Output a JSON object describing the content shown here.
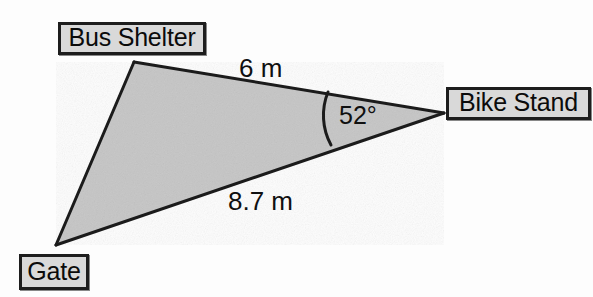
{
  "figure": {
    "kind": "triangle-survey-diagram",
    "background_color": "#fdfdfd",
    "triangle": {
      "fill_color": "#c5c5c5",
      "stroke_color": "#1b1b1b",
      "vertices": [
        {
          "name": "bus-shelter",
          "label": "Bus Shelter",
          "x": 134,
          "y": 62
        },
        {
          "name": "bike-stand",
          "label": "Bike Stand",
          "x": 444,
          "y": 113
        },
        {
          "name": "gate",
          "label": "Gate",
          "x": 56,
          "y": 245
        }
      ]
    },
    "labels": {
      "bus_shelter": "Bus Shelter",
      "bike_stand": "Bike Stand",
      "gate": "Gate",
      "box_fill_color": "#d9d9d9",
      "box_border_color": "#1d1d1d",
      "text_color": "#0b0b0b"
    },
    "measurements": {
      "side_bus_shelter_to_bike_stand": "6 m",
      "side_gate_to_bike_stand": "8.7 m",
      "angle_at_bike_stand": "52°"
    },
    "angle_marker": {
      "at_vertex": "bike-stand",
      "arc_start_x": 328,
      "arc_start_y": 92,
      "arc_end_x": 331,
      "arc_end_y": 145,
      "stroke_color": "#1b1b1b"
    }
  }
}
